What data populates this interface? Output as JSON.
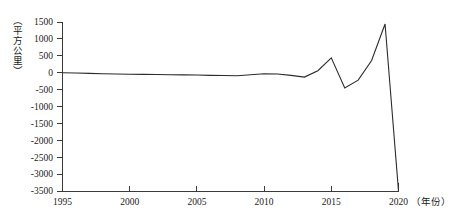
{
  "chart_data": {
    "type": "line",
    "title": "",
    "subtitle": "",
    "xlabel": "（年份）",
    "ylabel": "（平方公里）",
    "xlim": [
      1995,
      2020
    ],
    "ylim": [
      -3500,
      1500
    ],
    "grid": false,
    "legend": null,
    "x_ticks": [
      "1995",
      "2000",
      "2005",
      "2010",
      "2015",
      "2020"
    ],
    "x_tick_values": [
      1995,
      2000,
      2005,
      2010,
      2015,
      2020
    ],
    "y_ticks": [
      "1500",
      "1000",
      "500",
      "0",
      "-500",
      "-1000",
      "-1500",
      "-2000",
      "-2500",
      "-3000",
      "-3500"
    ],
    "y_tick_values": [
      1500,
      1000,
      500,
      0,
      -500,
      -1000,
      -1500,
      -2000,
      -2500,
      -3000,
      -3500
    ],
    "series": [
      {
        "name": "面积变化",
        "color": "#2b2b2b",
        "x": [
          1995,
          1996,
          1997,
          1998,
          1999,
          2000,
          2001,
          2002,
          2003,
          2004,
          2005,
          2006,
          2007,
          2008,
          2009,
          2010,
          2011,
          2012,
          2013,
          2014,
          2015,
          2016,
          2017,
          2018,
          2019,
          2020
        ],
        "values": [
          0,
          -10,
          -20,
          -30,
          -40,
          -45,
          -50,
          -55,
          -60,
          -65,
          -70,
          -80,
          -85,
          -90,
          -60,
          -30,
          -40,
          -80,
          -130,
          60,
          440,
          -450,
          -220,
          360,
          1440,
          -3500
        ]
      }
    ],
    "annotations": []
  },
  "axis": {
    "y_unit_label": "（平方公里）",
    "x_unit_label": "（年份）"
  }
}
